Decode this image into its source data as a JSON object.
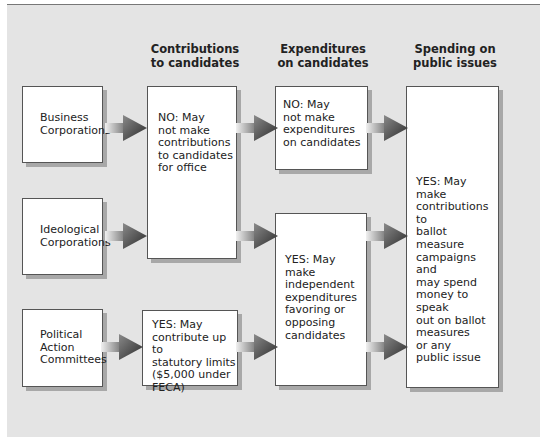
{
  "headers": {
    "contributions": "Contributions\nto candidates",
    "expenditures": "Expenditures\non candidates",
    "spending": "Spending on\npublic issues"
  },
  "entities": {
    "business": "Business\nCorporations",
    "ideological": "Ideological\nCorporations",
    "pac": "Political\nAction\nCommittees"
  },
  "outcomes": {
    "corp_contributions": "NO: May\nnot make\ncontributions\nto candidates\nfor office",
    "pac_contributions": "YES: May\ncontribute up to\nstatutory limits\n($5,000 under\nFECA)",
    "business_expenditures": "NO: May\nnot make\nexpenditures\non candidates",
    "independent_expenditures": "YES: May make\nindependent\nexpenditures\nfavoring or\nopposing\ncandidates",
    "public_issues": "YES: May make\ncontributions to\nballot measure\ncampaigns and\nmay spend\nmoney to speak\nout on ballot\nmeasures\nor any\npublic issue"
  }
}
